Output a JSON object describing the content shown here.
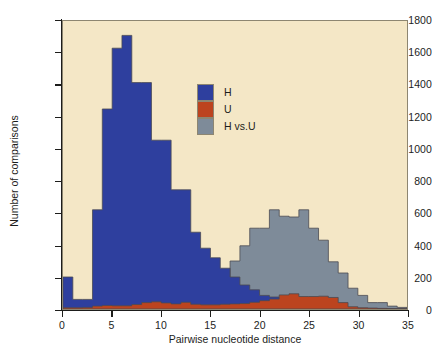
{
  "chart_data": {
    "type": "bar",
    "title": "",
    "subtitle": "",
    "xlabel": "Pairwise nucleotide distance",
    "ylabel": "Number of comparisons",
    "xlim": [
      0,
      35
    ],
    "ylim": [
      0,
      1800
    ],
    "xticks": [
      0,
      5,
      10,
      15,
      20,
      25,
      30,
      35
    ],
    "yticks": [
      0,
      200,
      400,
      600,
      800,
      1000,
      1200,
      1400,
      1600,
      1800
    ],
    "grid": false,
    "bin_width": 1,
    "plot_background": "#f4e7c6",
    "legend": {
      "position": "upper-center",
      "entries": [
        {
          "name": "H",
          "color": "#2e3f9e"
        },
        {
          "name": "U",
          "color": "#bc441f"
        },
        {
          "name": "H vs.U",
          "color": "#7e8b99"
        }
      ]
    },
    "x": [
      0,
      1,
      2,
      3,
      4,
      5,
      6,
      7,
      8,
      9,
      10,
      11,
      12,
      13,
      14,
      15,
      16,
      17,
      18,
      19,
      20,
      21,
      22,
      23,
      24,
      25,
      26,
      27,
      28,
      29,
      30,
      31,
      32,
      33,
      34
    ],
    "series": [
      {
        "name": "H",
        "color": "#2e3f9e",
        "values": [
          200,
          60,
          60,
          620,
          1250,
          1630,
          1710,
          1415,
          1415,
          1055,
          1055,
          745,
          745,
          480,
          380,
          320,
          255,
          200,
          150,
          120,
          85,
          75,
          0,
          0,
          0,
          0,
          0,
          0,
          0,
          0,
          0,
          0,
          0,
          0,
          0
        ]
      },
      {
        "name": "U",
        "color": "#bc441f",
        "values": [
          8,
          8,
          10,
          18,
          22,
          20,
          20,
          28,
          40,
          45,
          38,
          32,
          42,
          30,
          26,
          26,
          30,
          32,
          34,
          42,
          52,
          62,
          88,
          95,
          78,
          78,
          80,
          72,
          40,
          14,
          8,
          6,
          4,
          2,
          2
        ]
      },
      {
        "name": "H vs.U",
        "color": "#7e8b99",
        "values": [
          0,
          0,
          0,
          0,
          0,
          0,
          0,
          0,
          0,
          0,
          0,
          0,
          0,
          0,
          0,
          130,
          200,
          300,
          395,
          505,
          505,
          620,
          580,
          575,
          620,
          505,
          430,
          295,
          225,
          130,
          85,
          40,
          40,
          18,
          10
        ]
      }
    ]
  },
  "axis": {
    "x_title": "Pairwise nucleotide distance",
    "y_title": "Number of comparisons",
    "x_tick_labels": [
      "0",
      "5",
      "10",
      "15",
      "20",
      "25",
      "30",
      "35"
    ],
    "y_tick_labels": [
      "0",
      "200",
      "400",
      "600",
      "800",
      "1000",
      "1200",
      "1400",
      "1600",
      "1800"
    ]
  },
  "legend": {
    "items": [
      {
        "label": "H",
        "color": "#2e3f9e"
      },
      {
        "label": "U",
        "color": "#bc441f"
      },
      {
        "label": "H vs.U",
        "color": "#7e8b99"
      }
    ]
  },
  "colors": {
    "h": "#2e3f9e",
    "u": "#bc441f",
    "h_vs_u": "#7e8b99",
    "plot_background": "#f4e7c6",
    "page_background": "#ffffff",
    "axis": "#1d1d1b",
    "frame": "#8d8671"
  }
}
